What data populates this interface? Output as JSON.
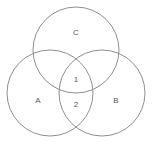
{
  "diagram": {
    "type": "venn-3-circle",
    "background_color": "#ffffff",
    "stroke_color": "#8f8f8f",
    "stroke_width": 1,
    "text_color": "#5a5a5a",
    "canvas": {
      "width": 152,
      "height": 144
    },
    "circles": [
      {
        "id": "C",
        "label": "C",
        "cx": 76,
        "cy": 50,
        "r": 43
      },
      {
        "id": "A",
        "label": "A",
        "cx": 50,
        "cy": 93,
        "r": 43
      },
      {
        "id": "B",
        "label": "B",
        "cx": 102,
        "cy": 93,
        "r": 43
      }
    ],
    "set_labels": [
      {
        "name": "set-label-c",
        "text": "C",
        "x": 76,
        "y": 32
      },
      {
        "name": "set-label-a",
        "text": "A",
        "x": 38,
        "y": 100
      },
      {
        "name": "set-label-b",
        "text": "B",
        "x": 116,
        "y": 100
      }
    ],
    "region_labels": [
      {
        "name": "region-label-1",
        "text": "1",
        "x": 76,
        "y": 79,
        "region": "A-and-B-and-C"
      },
      {
        "name": "region-label-2",
        "text": "2",
        "x": 76,
        "y": 104,
        "region": "A-and-B-only"
      }
    ]
  },
  "chart_data": {
    "type": "venn",
    "title": "",
    "sets": [
      "A",
      "B",
      "C"
    ],
    "labels": [
      "C",
      "A",
      "B",
      "1",
      "2"
    ],
    "regions": [
      {
        "label": "C",
        "sets": [
          "C"
        ],
        "value": "C"
      },
      {
        "label": "A",
        "sets": [
          "A"
        ],
        "value": "A"
      },
      {
        "label": "B",
        "sets": [
          "B"
        ],
        "value": "B"
      },
      {
        "label": "1",
        "sets": [
          "A",
          "B",
          "C"
        ],
        "value": "1"
      },
      {
        "label": "2",
        "sets": [
          "A",
          "B"
        ],
        "value": "2"
      }
    ],
    "grid": false,
    "legend": "none"
  }
}
